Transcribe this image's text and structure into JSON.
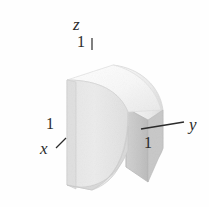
{
  "figure": {
    "kind": "3d-solid-diagram",
    "background_color": "#fefefe",
    "ink_color": "#2b2b2b",
    "surface_colors": {
      "front_face": "#e8e8e8",
      "left_face": "#e2e2e2",
      "top_face": "#fbfbfb",
      "curved_face": "#f2f2f2",
      "shadow_face": "#c9c9c9",
      "edge": "#bdbdbd"
    }
  },
  "axes": [
    {
      "id": "z",
      "label": "z",
      "tick_value": "1",
      "tick_style": "vertical"
    },
    {
      "id": "x",
      "label": "x",
      "tick_value": "1",
      "tick_style": "diagonal"
    },
    {
      "id": "y",
      "label": "y",
      "tick_value": "1",
      "tick_style": "leader-line"
    }
  ],
  "labels": {
    "z_axis": "z",
    "x_axis": "x",
    "y_axis": "y",
    "z_unit": "1",
    "x_unit": "1",
    "y_unit": "1"
  }
}
